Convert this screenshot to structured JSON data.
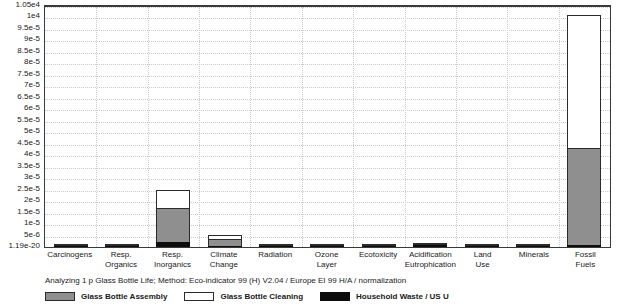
{
  "caption": "Analyzing 1 p Glass Bottle Life;  Method: Eco-indicator 99 (H) V2.04 /  Europe EI 99 H/A / normalization",
  "legend": {
    "position": "bottom",
    "items": [
      {
        "label": "Glass Bottle Assembly",
        "swatch": "assembly",
        "color": "#8f8f8f"
      },
      {
        "label": "Glass Bottle Cleaning",
        "swatch": "cleaning",
        "color": "#ffffff"
      },
      {
        "label": "Household Waste / US U",
        "swatch": "waste",
        "color": "#0d0d0d"
      }
    ]
  },
  "y_axis": {
    "tick_labels": [
      "1.05e4",
      "1e4",
      "9.5e-5",
      "9e-5",
      "8.5e-5",
      "8e-5",
      "7.5e-5",
      "7e-5",
      "6.5e-5",
      "6e-5",
      "5.5e-5",
      "5e-5",
      "4.5e-5",
      "4e-5",
      "3.5e-5",
      "3e-5",
      "2.5e-5",
      "2e-5",
      "1.5e-5",
      "1e-5",
      "5e-6",
      "1.19e-20"
    ],
    "min_label": "1.19e-20",
    "max_label": "1.05e4"
  },
  "chart_data": {
    "type": "bar",
    "title": "",
    "subtitle": "Analyzing 1 p Glass Bottle Life;  Method: Eco-indicator 99 (H) V2.04 /  Europe EI 99 H/A / normalization",
    "xlabel": "",
    "ylabel": "",
    "stacked": true,
    "grid": true,
    "legend_position": "bottom",
    "ylim": [
      0,
      0.000105
    ],
    "yticks": [
      0,
      5e-06,
      1e-05,
      1.5e-05,
      2e-05,
      2.5e-05,
      3e-05,
      3.5e-05,
      4e-05,
      4.5e-05,
      5e-05,
      5.5e-05,
      6e-05,
      6.5e-05,
      7e-05,
      7.5e-05,
      8e-05,
      8.5e-05,
      9e-05,
      9.5e-05,
      0.0001,
      0.000105
    ],
    "ytick_labels": [
      "1.19e-20",
      "5e-6",
      "1e-5",
      "1.5e-5",
      "2e-5",
      "2.5e-5",
      "3e-5",
      "3.5e-5",
      "4e-5",
      "4.5e-5",
      "5e-5",
      "5.5e-5",
      "6e-5",
      "6.5e-5",
      "7e-5",
      "7.5e-5",
      "8e-5",
      "8.5e-5",
      "9e-5",
      "9.5e-5",
      "1e4",
      "1.05e4"
    ],
    "categories": [
      "Carcinogens",
      "Resp. Organics",
      "Resp. Inorganics",
      "Climate Change",
      "Radiation",
      "Ozone Layer",
      "Ecotoxicity",
      "Acidification Eutrophication",
      "Land Use",
      "Minerals",
      "Fossil Fuels"
    ],
    "series": [
      {
        "name": "Glass Bottle Assembly",
        "color": "#8f8f8f",
        "values": [
          4e-07,
          2e-07,
          1.55e-05,
          3.5e-06,
          1e-07,
          1e-07,
          6e-07,
          9e-07,
          2e-07,
          3e-07,
          4.3e-05
        ]
      },
      {
        "name": "Glass Bottle Cleaning",
        "color": "#ffffff",
        "values": [
          2e-07,
          1e-07,
          8e-06,
          2e-06,
          1e-07,
          1e-07,
          6e-07,
          4e-07,
          2e-07,
          2e-07,
          5.8e-05
        ]
      },
      {
        "name": "Household Waste / US U",
        "color": "#0d0d0d",
        "values": [
          9e-07,
          3e-07,
          2.5e-06,
          2e-07,
          2e-07,
          2e-07,
          3e-07,
          1.2e-06,
          3e-07,
          3e-07,
          1.2e-06
        ]
      }
    ]
  }
}
